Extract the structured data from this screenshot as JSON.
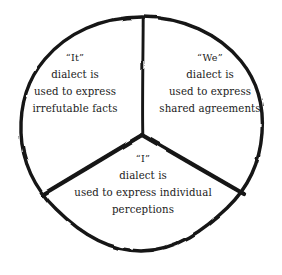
{
  "figure": {
    "type": "trisected-circle",
    "background_color": "#ffffff",
    "stroke_color": "#141414",
    "circle": {
      "center_x": 142,
      "center_y": 134,
      "radius": 117,
      "stroke_width": 3.4
    },
    "dividers": [
      {
        "name": "divider-up",
        "angle_degrees": 90,
        "stroke_width": 3.0
      },
      {
        "name": "divider-lower-left",
        "angle_degrees": 210,
        "stroke_width": 4.2
      },
      {
        "name": "divider-lower-right",
        "angle_degrees": 330,
        "stroke_width": 4.2
      }
    ]
  },
  "sectors": [
    {
      "id": "it",
      "name": "it-sector",
      "position": "upper-left",
      "label": "“It”",
      "lines": [
        "“It”",
        "dialect is",
        "used to express",
        "irrefutable facts"
      ],
      "full_text": "“It” dialect is used to express irrefutable facts"
    },
    {
      "id": "we",
      "name": "we-sector",
      "position": "upper-right",
      "label": "“We”",
      "lines": [
        "“We”",
        "dialect is",
        "used to express",
        "shared agreements"
      ],
      "full_text": "“We” dialect is used to express shared agreements"
    },
    {
      "id": "i",
      "name": "i-sector",
      "position": "bottom",
      "label": "“I”",
      "lines": [
        "“I”",
        "dialect is",
        "used to express individual",
        "perceptions"
      ],
      "full_text": "“I” dialect is used to express individual perceptions"
    }
  ]
}
